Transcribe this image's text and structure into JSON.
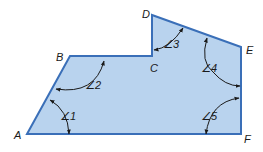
{
  "figure": {
    "type": "polygon",
    "fill_color": "#b9d3ee",
    "stroke_color": "#3a6fb8",
    "vertices": [
      {
        "name": "A",
        "x": 27,
        "y": 134,
        "label_x": 14,
        "label_y": 139
      },
      {
        "name": "B",
        "x": 70,
        "y": 56,
        "label_x": 56,
        "label_y": 61
      },
      {
        "name": "C",
        "x": 152,
        "y": 56,
        "label_x": 150,
        "label_y": 72
      },
      {
        "name": "D",
        "x": 152,
        "y": 15,
        "label_x": 142,
        "label_y": 18
      },
      {
        "name": "E",
        "x": 241,
        "y": 47,
        "label_x": 246,
        "label_y": 54
      },
      {
        "name": "F",
        "x": 241,
        "y": 134,
        "label_x": 244,
        "label_y": 143
      }
    ],
    "angles": [
      {
        "label": "∠1",
        "x": 61,
        "y": 120
      },
      {
        "label": "∠2",
        "x": 85,
        "y": 88
      },
      {
        "label": "∠3",
        "x": 166,
        "y": 48
      },
      {
        "label": "∠4",
        "x": 203,
        "y": 71
      },
      {
        "label": "∠5",
        "x": 203,
        "y": 119
      }
    ]
  }
}
